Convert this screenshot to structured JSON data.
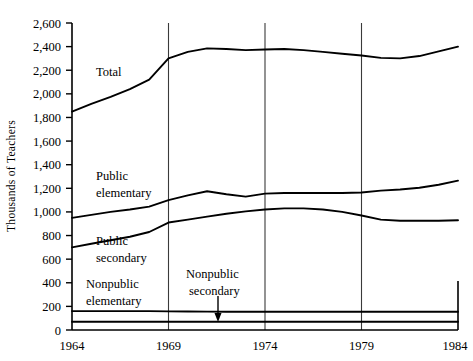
{
  "chart_data": {
    "type": "line",
    "title": "",
    "xlabel": "",
    "ylabel": "Thousands of  Teachers",
    "xlim": [
      1964,
      1984
    ],
    "ylim": [
      0,
      2600
    ],
    "grid": "vertical-only",
    "legend_position": "inline-annotations",
    "xticks": [
      "1964",
      "1969",
      "1974",
      "1979",
      "1984"
    ],
    "xtick_values": [
      1964,
      1969,
      1974,
      1979,
      1984
    ],
    "yticks": [
      "0",
      "200",
      "400",
      "600",
      "800",
      "1,000",
      "1,200",
      "1,400",
      "1,600",
      "1,800",
      "2,000",
      "2,200",
      "2,400",
      "2,600"
    ],
    "ytick_values": [
      0,
      200,
      400,
      600,
      800,
      1000,
      1200,
      1400,
      1600,
      1800,
      2000,
      2200,
      2400,
      2600
    ],
    "x": [
      1964,
      1965,
      1966,
      1967,
      1968,
      1969,
      1970,
      1971,
      1972,
      1973,
      1974,
      1975,
      1976,
      1977,
      1978,
      1979,
      1980,
      1981,
      1982,
      1983,
      1984
    ],
    "series": [
      {
        "name": "Total",
        "values": [
          1850,
          1915,
          1975,
          2040,
          2120,
          2300,
          2355,
          2385,
          2380,
          2370,
          2375,
          2380,
          2370,
          2355,
          2340,
          2325,
          2305,
          2300,
          2320,
          2360,
          2400
        ]
      },
      {
        "name": "Public elementary",
        "values": [
          950,
          975,
          1000,
          1020,
          1045,
          1100,
          1140,
          1175,
          1150,
          1130,
          1155,
          1160,
          1160,
          1160,
          1160,
          1165,
          1180,
          1190,
          1205,
          1230,
          1265
        ]
      },
      {
        "name": "Public secondary",
        "values": [
          700,
          730,
          760,
          790,
          830,
          910,
          935,
          960,
          985,
          1005,
          1020,
          1030,
          1030,
          1020,
          1000,
          970,
          935,
          925,
          925,
          925,
          930
        ]
      },
      {
        "name": "Nonpublic elementary",
        "values": [
          160,
          160,
          160,
          160,
          160,
          158,
          157,
          156,
          155,
          155,
          155,
          155,
          155,
          155,
          155,
          155,
          155,
          155,
          155,
          155,
          155
        ]
      },
      {
        "name": "Nonpublic secondary",
        "values": [
          70,
          70,
          70,
          70,
          70,
          70,
          70,
          70,
          70,
          70,
          70,
          70,
          70,
          70,
          70,
          70,
          70,
          70,
          70,
          70,
          70
        ]
      }
    ],
    "annotations": [
      {
        "text": "Total",
        "target_series": "Total"
      },
      {
        "text": "Public",
        "target_series": "Public elementary"
      },
      {
        "text": "elementary",
        "target_series": "Public elementary"
      },
      {
        "text": "Public",
        "target_series": "Public secondary"
      },
      {
        "text": "secondary",
        "target_series": "Public secondary"
      },
      {
        "text": "Nonpublic",
        "target_series": "Nonpublic elementary"
      },
      {
        "text": "elementary",
        "target_series": "Nonpublic elementary"
      },
      {
        "text": "Nonpublic",
        "target_series": "Nonpublic secondary"
      },
      {
        "text": "secondary",
        "target_series": "Nonpublic secondary"
      }
    ]
  },
  "labels": {
    "y_axis_title": "Thousands of  Teachers",
    "total": "Total",
    "public_1": "Public",
    "public_elementary_2": "elementary",
    "public_2": "Public",
    "public_secondary_2": "secondary",
    "nonpublic_elem_1": "Nonpublic",
    "nonpublic_elem_2": "elementary",
    "nonpublic_sec_1": "Nonpublic",
    "nonpublic_sec_2": "secondary"
  },
  "yticks": {
    "t0": "0",
    "t1": "200",
    "t2": "400",
    "t3": "600",
    "t4": "800",
    "t5": "1,000",
    "t6": "1,200",
    "t7": "1,400",
    "t8": "1,600",
    "t9": "1,800",
    "t10": "2,000",
    "t11": "2,200",
    "t12": "2,400",
    "t13": "2,600"
  },
  "xticks": {
    "x0": "1964",
    "x1": "1969",
    "x2": "1974",
    "x3": "1979",
    "x4": "1984"
  },
  "colors": {
    "line": "#000000",
    "grid": "#3a3a3a",
    "background": "#ffffff"
  }
}
